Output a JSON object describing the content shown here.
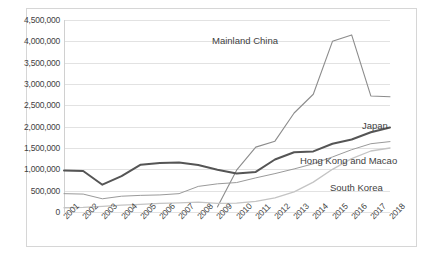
{
  "chart_data": {
    "type": "line",
    "title": "",
    "xlabel": "",
    "ylabel": "",
    "grid": true,
    "legend_position": "inline-series-labels",
    "ylim": [
      0,
      4500000
    ],
    "ytick_labels": [
      "4,500,000",
      "4,000,000",
      "3,500,000",
      "3,000,000",
      "2,500,000",
      "2,000,000",
      "1,500,000",
      "1,000,000",
      "500,000",
      "0"
    ],
    "ytick_values": [
      4500000,
      4000000,
      3500000,
      3000000,
      2500000,
      2000000,
      1500000,
      1000000,
      500000,
      0
    ],
    "categories": [
      "2001",
      "2002",
      "2003",
      "2004",
      "2005",
      "2006",
      "2007",
      "2008",
      "2009",
      "2010",
      "2011",
      "2012",
      "2013",
      "2014",
      "2015",
      "2016",
      "2017",
      "2018"
    ],
    "series": [
      {
        "name": "Mainland China",
        "color": "#8c8c8c",
        "width": 1.1,
        "values": [
          null,
          null,
          null,
          null,
          null,
          null,
          null,
          null,
          120000,
          980000,
          1520000,
          1660000,
          2320000,
          2760000,
          4000000,
          4150000,
          2720000,
          2700000
        ]
      },
      {
        "name": "Japan",
        "color": "#555555",
        "width": 2.0,
        "values": [
          970000,
          960000,
          640000,
          840000,
          1110000,
          1150000,
          1160000,
          1100000,
          990000,
          900000,
          940000,
          1230000,
          1400000,
          1420000,
          1600000,
          1700000,
          1870000,
          1980000
        ]
      },
      {
        "name": "Hong Kong and Macao",
        "color": "#9a9a9a",
        "width": 1.0,
        "values": [
          430000,
          420000,
          310000,
          370000,
          390000,
          400000,
          430000,
          600000,
          660000,
          690000,
          800000,
          900000,
          1010000,
          1130000,
          1290000,
          1460000,
          1600000,
          1650000
        ]
      },
      {
        "name": "South Korea",
        "color": "#c4c4c4",
        "width": 1.3,
        "values": [
          100000,
          110000,
          130000,
          160000,
          180000,
          200000,
          215000,
          230000,
          200000,
          210000,
          250000,
          330000,
          470000,
          700000,
          1000000,
          1250000,
          1430000,
          1500000
        ]
      }
    ]
  },
  "series_labels": {
    "china": "Mainland China",
    "japan": "Japan",
    "hkmacao": "Hong Kong and Macao",
    "skorea": "South Korea"
  }
}
